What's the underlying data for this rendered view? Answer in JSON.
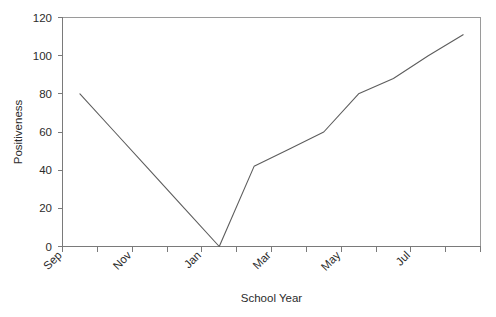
{
  "chart_data": {
    "type": "line",
    "title": "",
    "xlabel": "School Year",
    "ylabel": "Positiveness",
    "categories": [
      "Sep",
      "Oct",
      "Nov",
      "Dec",
      "Jan",
      "Feb",
      "Mar",
      "Apr",
      "May",
      "Jun",
      "Jul",
      "Aug"
    ],
    "x_tick_labels": [
      "Sep",
      "",
      "Nov",
      "",
      "Jan",
      "",
      "Mar",
      "",
      "May",
      "",
      "Jul",
      ""
    ],
    "x_tick_label_rotation": 45,
    "x_tick_count": 13,
    "values": [
      80,
      60,
      40,
      20,
      0,
      42,
      51,
      60,
      80,
      88,
      100,
      111
    ],
    "y_tick_labels": [
      "0",
      "20",
      "40",
      "60",
      "80",
      "100",
      "120"
    ],
    "y_ticks": [
      0,
      20,
      40,
      60,
      80,
      100,
      120
    ],
    "ylim": [
      0,
      120
    ],
    "xlim": [
      0,
      12
    ],
    "grid": false,
    "legend": false,
    "legend_position": "none",
    "line_color": "#5d5d5d",
    "axis_color": "#7a7a7a",
    "text_color": "#2b2b2b",
    "background_color": "#ffffff"
  }
}
